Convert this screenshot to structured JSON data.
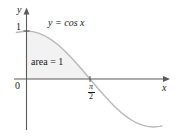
{
  "figure": {
    "axis_label_y": "y",
    "axis_label_x": "x",
    "tick_label_one": "1",
    "tick_label_origin": "0",
    "tick_label_pi_numerator": "π",
    "tick_label_pi_denominator": "2",
    "curve_label": "y = cos x",
    "area_label": "area = 1",
    "colors": {
      "axis": "#5a5a5a",
      "curve": "#b5b5b5",
      "shade": "#f2f2f2",
      "text": "#1a1a1a",
      "background": "#ffffff"
    }
  },
  "chart_data": {
    "type": "line",
    "title": "",
    "xlabel": "x",
    "ylabel": "y",
    "xlim": [
      -0.25,
      3.35
    ],
    "ylim": [
      -1.15,
      1.25
    ],
    "grid": false,
    "legend": "none",
    "xticks": [
      0,
      1.5707963
    ],
    "xticklabels": [
      "0",
      "π/2"
    ],
    "yticks": [
      1
    ],
    "yticklabels": [
      "1"
    ],
    "series": [
      {
        "name": "y = cos x",
        "function": "cos(x)",
        "x": [
          0,
          0.1571,
          0.3142,
          0.4712,
          0.6283,
          0.7854,
          0.9425,
          1.0996,
          1.2566,
          1.4137,
          1.5708,
          1.7279,
          1.885,
          2.042,
          2.1991,
          2.3562,
          2.5133,
          2.6704,
          2.8274,
          2.9845,
          3.1416,
          3.3
        ],
        "y": [
          1.0,
          0.9877,
          0.9511,
          0.891,
          0.809,
          0.7071,
          0.5878,
          0.454,
          0.309,
          0.1564,
          0.0,
          -0.1564,
          -0.309,
          -0.454,
          -0.5878,
          -0.7071,
          -0.809,
          -0.891,
          -0.9511,
          -0.9877,
          -1.0,
          -0.9874
        ]
      }
    ],
    "shaded_region": {
      "label": "area = 1",
      "x_from": 0,
      "x_to": 1.5707963,
      "value": 1
    },
    "annotations": [
      {
        "text": "y = cos x",
        "x": 0.75,
        "y": 1.12
      },
      {
        "text": "area = 1",
        "x": 0.45,
        "y": 0.36
      }
    ]
  }
}
